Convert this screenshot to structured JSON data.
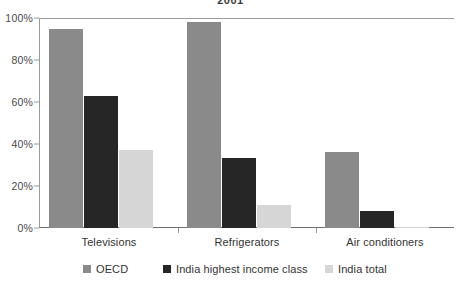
{
  "chart_data": {
    "type": "bar",
    "title": "2001",
    "xlabel": "",
    "ylabel": "",
    "ylim": [
      0,
      100
    ],
    "ytick_labels": [
      "0%",
      "20%",
      "40%",
      "60%",
      "80%",
      "100%"
    ],
    "ytick_values": [
      0,
      20,
      40,
      60,
      80,
      100
    ],
    "grid": false,
    "legend_position": "bottom",
    "categories": [
      "Televisions",
      "Refrigerators",
      "Air conditioners"
    ],
    "series": [
      {
        "name": "OECD",
        "color": "#8a8a8a",
        "values": [
          95,
          98,
          36
        ]
      },
      {
        "name": "India highest income class",
        "color": "#262626",
        "values": [
          63,
          33.5,
          8
        ]
      },
      {
        "name": "India total",
        "color": "#d6d6d6",
        "values": [
          37,
          11,
          0.5
        ]
      }
    ]
  },
  "axis": {
    "baseline_color": "#6f6f6f",
    "frame_color": "#9a9a9a"
  }
}
